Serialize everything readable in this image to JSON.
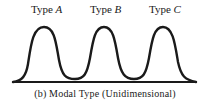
{
  "diagram": {
    "mode_labels": [
      {
        "prefix": "Type ",
        "letter": "A"
      },
      {
        "prefix": "Type ",
        "letter": "B"
      },
      {
        "prefix": "Type ",
        "letter": "C"
      }
    ],
    "caption": "(b) Modal Type (Unidimensional)",
    "curve": "trimodal distribution with three equal peaks over a baseline",
    "colors": {
      "line": "#1a1a1a",
      "background": "#ffffff"
    }
  }
}
